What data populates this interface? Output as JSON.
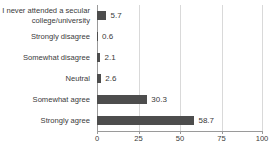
{
  "chart_data": {
    "type": "bar",
    "orientation": "horizontal",
    "title": "",
    "subtitle": "",
    "xlabel": "",
    "ylabel": "",
    "categories": [
      "I never attended a secular college/university",
      "Strongly disagree",
      "Somewhat disagree",
      "Neutral",
      "Somewhat agree",
      "Strongly agree"
    ],
    "values": [
      5.7,
      0.6,
      2.1,
      2.6,
      30.3,
      58.7
    ],
    "value_labels": [
      "5.7",
      "0.6",
      "2.1",
      "2.6",
      "30.3",
      "58.7"
    ],
    "xlim": [
      0,
      100
    ],
    "xticks": [
      0,
      25,
      50,
      75,
      100
    ],
    "xtick_labels": [
      "0",
      "25",
      "50",
      "75",
      "100"
    ],
    "grid": true,
    "grid_axis": "x",
    "legend": false,
    "legend_position": "none",
    "bar_color": "#4d4d4d",
    "grid_color": "#d9d9d9",
    "axis_color": "#9a9a9a",
    "text_color": "#3a3a3a",
    "background_color": "#ffffff"
  }
}
